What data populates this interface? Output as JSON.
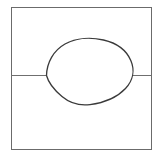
{
  "figure": {
    "title": "Line drawing: oval intersecting a bisected rectangle",
    "background_color": "#ffffff",
    "canvas": {
      "width": 160,
      "height": 157
    },
    "style": {
      "frame_stroke_color": "#6b6b6b",
      "frame_stroke_width": 1.0,
      "divider_stroke_color": "#6f6f6f",
      "divider_stroke_width": 1.0,
      "oval_stroke_color": "#3a3a3a",
      "oval_stroke_width": 1.3,
      "fill": "none"
    },
    "shapes": [
      {
        "name": "outer-rectangle",
        "type": "rectangle",
        "x": 11,
        "y": 7,
        "width": 140,
        "height": 142,
        "stroke": "#6b6b6b"
      },
      {
        "name": "divider-line-left",
        "type": "line",
        "x1": 11,
        "y1": 75.5,
        "x2": 47,
        "y2": 75.5,
        "stroke": "#6f6f6f"
      },
      {
        "name": "divider-line-right",
        "type": "line",
        "x1": 132,
        "y1": 75.5,
        "x2": 151,
        "y2": 75.5,
        "stroke": "#6f6f6f"
      },
      {
        "name": "egg-oval",
        "type": "closed-curve",
        "bounds": {
          "left": 46,
          "top": 39,
          "right": 133,
          "bottom": 105
        },
        "center": {
          "x": 90,
          "y": 72
        },
        "stroke": "#3a3a3a",
        "path": "M 46.5 75.5 C 46.8 62.5 53.5 50.5 65.0 44.0 C 76.5 37.6 91.5 37.2 103.5 40.0 C 116.5 43.0 126.5 50.5 130.8 60.5 C 135.0 70.2 133.0 80.5 125.5 88.5 C 117.5 97.0 104.0 102.8 90.0 104.6 C 79.0 106.0 70.0 103.2 62.0 96.5 C 54.0 89.8 48.5 83.0 46.5 75.5 Z"
      }
    ],
    "labels": [],
    "annotations": []
  }
}
